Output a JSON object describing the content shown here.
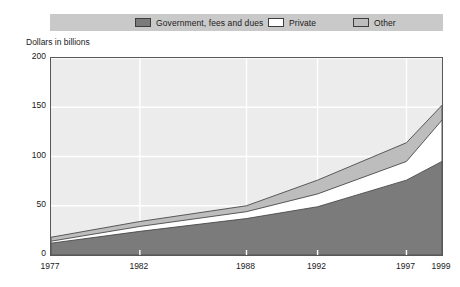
{
  "axis_title": "Dollars in billions",
  "legend": {
    "items": [
      {
        "label": "Government, fees and dues",
        "swatch": "gov",
        "color": "#7b7b7b"
      },
      {
        "label": "Private",
        "swatch": "private",
        "color": "#ffffff"
      },
      {
        "label": "Other",
        "swatch": "other",
        "color": "#bdbdbd"
      }
    ]
  },
  "chart_data": {
    "type": "area",
    "title": "",
    "subtitle": "",
    "xlabel": "",
    "ylabel": "Dollars in billions",
    "stacked": true,
    "grid": true,
    "legend_position": "top",
    "x": [
      1977,
      1982,
      1988,
      1992,
      1997,
      1999
    ],
    "categories": [
      "1977",
      "1982",
      "1988",
      "1992",
      "1997",
      "1999"
    ],
    "xtick_labels": [
      "1977",
      "1982",
      "1988",
      "1992",
      "1997",
      "1999"
    ],
    "ytick_labels": [
      "0",
      "50",
      "100",
      "150",
      "200"
    ],
    "ytick_values": [
      0,
      50,
      100,
      150,
      200
    ],
    "xlim": [
      1977,
      1999
    ],
    "ylim": [
      0,
      200
    ],
    "series": [
      {
        "name": "Government, fees and dues",
        "color": "#7b7b7b",
        "values": [
          12,
          24,
          37,
          49,
          76,
          95
        ]
      },
      {
        "name": "Private",
        "color": "#ffffff",
        "values": [
          2,
          5,
          7,
          13,
          19,
          42
        ]
      },
      {
        "name": "Other",
        "color": "#bdbdbd",
        "values": [
          4,
          5,
          6,
          14,
          19,
          15
        ]
      }
    ],
    "cumulative_tops": {
      "government": [
        12,
        24,
        37,
        49,
        76,
        95
      ],
      "government_plus_private": [
        14,
        29,
        44,
        62,
        95,
        137
      ],
      "total": [
        18,
        34,
        50,
        76,
        114,
        152
      ]
    }
  },
  "colors": {
    "plot_background": "#ececec",
    "legend_background": "#c9c9c9",
    "gridline": "#ffffff",
    "border": "#585858",
    "text": "#1a1a1a"
  }
}
